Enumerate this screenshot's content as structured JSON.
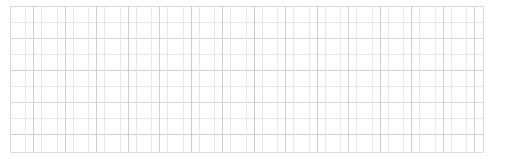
{
  "document": {
    "title": "Faint Grid Sheet",
    "type": "grid-pattern",
    "description": "Light gray hand-drawn style rectangular grid / graph paper"
  },
  "canvas": {
    "width": 506,
    "height": 167,
    "background_color": "#ffffff"
  },
  "grid": {
    "left": 10,
    "top": 6,
    "right": 483,
    "bottom": 152,
    "cell_width": 15.75,
    "cell_height": 16.2,
    "columns": 30,
    "rows": 9,
    "line_color_light": "#e6e6ea",
    "line_color_mid": "#dadade",
    "line_color_dark": "#c9c9cf",
    "border_color": "#dcdce0",
    "stroke_width": 1
  },
  "chart_data": {
    "type": "table",
    "title": "",
    "xlabel": "",
    "ylabel": "",
    "columns": 30,
    "rows": 9,
    "cell_values": [],
    "grid": true,
    "legend": "none"
  },
  "vertical_lines": [
    {
      "x": 10.0,
      "y1": 6,
      "y2": 152,
      "color": "#d6d6dc",
      "width": 1.0
    },
    {
      "x": 25.7,
      "y1": 6,
      "y2": 152,
      "color": "#e9e9ed",
      "width": 1.0
    },
    {
      "x": 33.0,
      "y1": 6,
      "y2": 152,
      "color": "#cdcdd4",
      "width": 1.0
    },
    {
      "x": 41.5,
      "y1": 6,
      "y2": 152,
      "color": "#e4e4e9",
      "width": 1.0
    },
    {
      "x": 57.2,
      "y1": 6,
      "y2": 152,
      "color": "#e7e7eb",
      "width": 1.0
    },
    {
      "x": 65.0,
      "y1": 6,
      "y2": 152,
      "color": "#d0d0d7",
      "width": 1.0
    },
    {
      "x": 73.0,
      "y1": 6,
      "y2": 152,
      "color": "#e6e6ea",
      "width": 1.0
    },
    {
      "x": 88.7,
      "y1": 6,
      "y2": 152,
      "color": "#e8e8ec",
      "width": 1.0
    },
    {
      "x": 96.5,
      "y1": 6,
      "y2": 152,
      "color": "#cfcfd6",
      "width": 1.0
    },
    {
      "x": 104.5,
      "y1": 6,
      "y2": 152,
      "color": "#e5e5ea",
      "width": 1.0
    },
    {
      "x": 120.2,
      "y1": 6,
      "y2": 152,
      "color": "#e8e8ec",
      "width": 1.0
    },
    {
      "x": 128.0,
      "y1": 6,
      "y2": 152,
      "color": "#cccdd3",
      "width": 1.0
    },
    {
      "x": 136.0,
      "y1": 6,
      "y2": 152,
      "color": "#e4e4e9",
      "width": 1.0
    },
    {
      "x": 151.7,
      "y1": 6,
      "y2": 152,
      "color": "#e9e9ed",
      "width": 1.0
    },
    {
      "x": 159.5,
      "y1": 6,
      "y2": 152,
      "color": "#d1d1d8",
      "width": 1.0
    },
    {
      "x": 167.5,
      "y1": 6,
      "y2": 152,
      "color": "#e6e6ea",
      "width": 1.0
    },
    {
      "x": 183.2,
      "y1": 6,
      "y2": 152,
      "color": "#e8e8ec",
      "width": 1.0
    },
    {
      "x": 191.0,
      "y1": 6,
      "y2": 152,
      "color": "#cbcbd2",
      "width": 1.0
    },
    {
      "x": 199.0,
      "y1": 6,
      "y2": 152,
      "color": "#e5e5e9",
      "width": 1.0
    },
    {
      "x": 214.7,
      "y1": 6,
      "y2": 152,
      "color": "#e7e7eb",
      "width": 1.0
    },
    {
      "x": 222.5,
      "y1": 6,
      "y2": 152,
      "color": "#cdcdd4",
      "width": 1.0
    },
    {
      "x": 230.5,
      "y1": 6,
      "y2": 152,
      "color": "#e6e6ea",
      "width": 1.0
    },
    {
      "x": 246.2,
      "y1": 6,
      "y2": 152,
      "color": "#e9e9ed",
      "width": 1.0
    },
    {
      "x": 254.0,
      "y1": 6,
      "y2": 152,
      "color": "#c6c6ce",
      "width": 1.0
    },
    {
      "x": 262.0,
      "y1": 6,
      "y2": 152,
      "color": "#e4e4e9",
      "width": 1.0
    },
    {
      "x": 277.7,
      "y1": 6,
      "y2": 152,
      "color": "#e8e8ec",
      "width": 1.0
    },
    {
      "x": 285.5,
      "y1": 6,
      "y2": 152,
      "color": "#cfcfd6",
      "width": 1.0
    },
    {
      "x": 293.5,
      "y1": 6,
      "y2": 152,
      "color": "#e5e5ea",
      "width": 1.0
    },
    {
      "x": 309.2,
      "y1": 6,
      "y2": 152,
      "color": "#e7e7eb",
      "width": 1.0
    },
    {
      "x": 317.0,
      "y1": 6,
      "y2": 152,
      "color": "#cacad1",
      "width": 1.0
    },
    {
      "x": 325.0,
      "y1": 6,
      "y2": 152,
      "color": "#e6e6ea",
      "width": 1.0
    },
    {
      "x": 340.7,
      "y1": 6,
      "y2": 152,
      "color": "#e9e9ed",
      "width": 1.0
    },
    {
      "x": 348.5,
      "y1": 6,
      "y2": 152,
      "color": "#d0d0d7",
      "width": 1.0
    },
    {
      "x": 356.5,
      "y1": 6,
      "y2": 152,
      "color": "#e4e4e9",
      "width": 1.0
    },
    {
      "x": 372.2,
      "y1": 6,
      "y2": 152,
      "color": "#e8e8ec",
      "width": 1.0
    },
    {
      "x": 380.0,
      "y1": 6,
      "y2": 152,
      "color": "#cdcdd4",
      "width": 1.0
    },
    {
      "x": 388.0,
      "y1": 6,
      "y2": 152,
      "color": "#e5e5e9",
      "width": 1.0
    },
    {
      "x": 403.7,
      "y1": 6,
      "y2": 152,
      "color": "#e7e7eb",
      "width": 1.0
    },
    {
      "x": 411.5,
      "y1": 6,
      "y2": 152,
      "color": "#cccdd3",
      "width": 1.0
    },
    {
      "x": 419.5,
      "y1": 6,
      "y2": 152,
      "color": "#e6e6ea",
      "width": 1.0
    },
    {
      "x": 435.2,
      "y1": 6,
      "y2": 152,
      "color": "#e9e9ed",
      "width": 1.0
    },
    {
      "x": 443.0,
      "y1": 6,
      "y2": 152,
      "color": "#cfcfd6",
      "width": 1.0
    },
    {
      "x": 451.0,
      "y1": 6,
      "y2": 152,
      "color": "#e4e4e9",
      "width": 1.0
    },
    {
      "x": 466.7,
      "y1": 6,
      "y2": 152,
      "color": "#e8e8ec",
      "width": 1.0
    },
    {
      "x": 474.5,
      "y1": 6,
      "y2": 152,
      "color": "#d2d2d9",
      "width": 1.0
    },
    {
      "x": 483.0,
      "y1": 6,
      "y2": 152,
      "color": "#dadae0",
      "width": 1.0
    }
  ],
  "horizontal_lines": [
    {
      "y": 6.0,
      "x1": 10,
      "x2": 483,
      "color": "#d8d8de",
      "width": 1.0
    },
    {
      "y": 22.5,
      "x1": 10,
      "x2": 483,
      "color": "#e7e7eb",
      "width": 1.0
    },
    {
      "y": 38.5,
      "x1": 10,
      "x2": 483,
      "color": "#d4d4db",
      "width": 1.0
    },
    {
      "y": 54.5,
      "x1": 10,
      "x2": 483,
      "color": "#e8e8ec",
      "width": 1.0
    },
    {
      "y": 70.5,
      "x1": 10,
      "x2": 483,
      "color": "#d2d2d9",
      "width": 1.0
    },
    {
      "y": 86.5,
      "x1": 10,
      "x2": 483,
      "color": "#e6e6ea",
      "width": 1.0
    },
    {
      "y": 102.5,
      "x1": 10,
      "x2": 483,
      "color": "#d5d5dc",
      "width": 1.0
    },
    {
      "y": 118.5,
      "x1": 10,
      "x2": 483,
      "color": "#e7e7eb",
      "width": 1.0
    },
    {
      "y": 134.5,
      "x1": 10,
      "x2": 483,
      "color": "#d0d0d7",
      "width": 1.0
    },
    {
      "y": 152.0,
      "x1": 10,
      "x2": 483,
      "color": "#dcdce2",
      "width": 1.0
    }
  ]
}
